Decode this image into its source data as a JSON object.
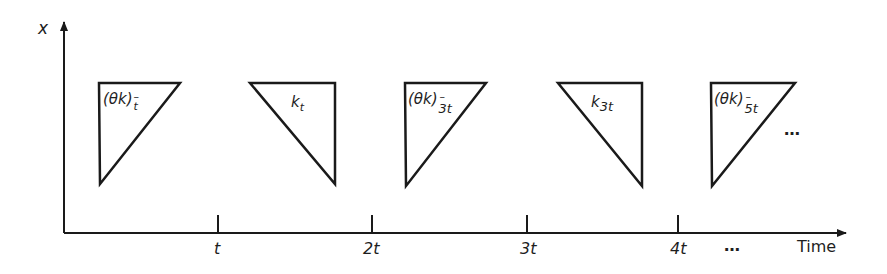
{
  "diagram": {
    "y_axis_label": "x",
    "x_axis_label": "Time",
    "x_axis_ticks": [
      {
        "label": "t",
        "x": 218
      },
      {
        "label": "2t",
        "x": 372
      },
      {
        "label": "3t",
        "x": 527
      },
      {
        "label": "4t",
        "x": 678
      }
    ],
    "axis_continuation": "…",
    "sequence_continuation": "…",
    "triangles": [
      {
        "kind": "theta-k",
        "base": "(θk)",
        "sup": "–",
        "sub": "t",
        "orientation": "right-angle-left",
        "points": "99,83 180,83 100,184"
      },
      {
        "kind": "k",
        "base": "k",
        "sup": "",
        "sub": "t",
        "orientation": "right-angle-right",
        "points": "250,83 335,83 335,184"
      },
      {
        "kind": "theta-k",
        "base": "(θk)",
        "sup": "–",
        "sub": "3t",
        "orientation": "right-angle-left",
        "points": "405,83 486,83 406,186"
      },
      {
        "kind": "k",
        "base": "k",
        "sup": "",
        "sub": "3t",
        "orientation": "right-angle-right",
        "points": "558,83 642,83 642,186"
      },
      {
        "kind": "theta-k",
        "base": "(θk)",
        "sup": "–",
        "sub": "5t",
        "orientation": "right-angle-left",
        "points": "711,83 795,83 712,186"
      }
    ],
    "colors": {
      "stroke": "#1a1a1a",
      "background": "#ffffff"
    }
  }
}
